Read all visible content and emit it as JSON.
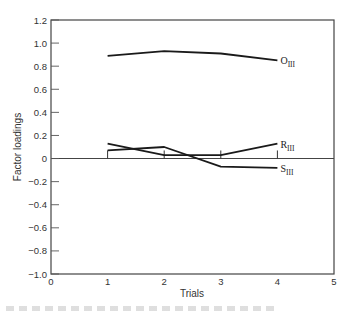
{
  "chart_data": {
    "type": "line",
    "title": "",
    "xlabel": "Trials",
    "ylabel": "Factor loadings",
    "xlim": [
      0,
      5
    ],
    "ylim": [
      -1.0,
      1.2
    ],
    "x_ticks": [
      "0",
      "1",
      "2",
      "3",
      "4",
      "5"
    ],
    "y_ticks": [
      "1.2",
      "1.0",
      "0.8",
      "0.6",
      "0.4",
      "0.2",
      "0",
      "−0.2",
      "−0.4",
      "−0.6",
      "−0.8",
      "−1.0"
    ],
    "x": [
      1,
      2,
      3,
      4
    ],
    "series": [
      {
        "name": "O",
        "subscript": "III",
        "values": [
          0.89,
          0.93,
          0.91,
          0.85
        ]
      },
      {
        "name": "R",
        "subscript": "III",
        "values": [
          0.13,
          0.03,
          0.03,
          0.13
        ]
      },
      {
        "name": "S",
        "subscript": "III",
        "values": [
          0.07,
          0.1,
          -0.07,
          -0.08
        ]
      }
    ],
    "markers": {
      "description": "vertical tick bars at each trial from 0 to 0.07",
      "height": 0.07
    },
    "grid": false,
    "zero_line": true,
    "legend": "inline labels at series ends"
  }
}
